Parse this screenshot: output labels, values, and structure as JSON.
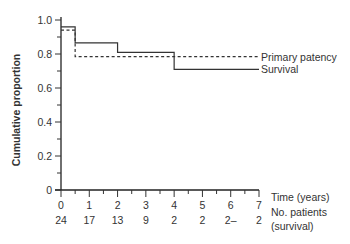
{
  "chart_data": {
    "type": "line",
    "subtype": "step (Kaplan-Meier)",
    "title": "",
    "xlabel": "Time (years)",
    "ylabel": "Cumulative proportion",
    "xlim": [
      0,
      7
    ],
    "ylim": [
      0,
      1.0
    ],
    "x_ticks": [
      "0",
      "1",
      "2",
      "3",
      "4",
      "5",
      "6",
      "7"
    ],
    "y_ticks": [
      "0",
      "0.2",
      "0.4",
      "0.6",
      "0.8",
      "1.0"
    ],
    "grid": false,
    "legend_position": "inline-right",
    "series": [
      {
        "name": "Primary patency",
        "style": "dashed",
        "steps": [
          {
            "x_start": 0,
            "x_end": 0.5,
            "y": 0.94
          },
          {
            "x_start": 0.5,
            "x_end": 7,
            "y": 0.785
          }
        ]
      },
      {
        "name": "Survival",
        "style": "solid",
        "steps": [
          {
            "x_start": 0,
            "x_end": 0.5,
            "y": 0.96
          },
          {
            "x_start": 0.5,
            "x_end": 2,
            "y": 0.865
          },
          {
            "x_start": 2,
            "x_end": 4,
            "y": 0.81
          },
          {
            "x_start": 4,
            "x_end": 7,
            "y": 0.71
          }
        ]
      }
    ],
    "at_risk": {
      "label_line1": "No. patients",
      "label_line2": "(survival)",
      "values": [
        "24",
        "17",
        "13",
        "9",
        "2",
        "2",
        "2–",
        "2"
      ]
    }
  },
  "labels": {
    "ylabel": "Cumulative proportion",
    "xlabel": "Time (years)",
    "atrisk1": "No. patients",
    "atrisk2": "(survival)",
    "legend_patency": "Primary patency",
    "legend_survival": "Survival"
  }
}
